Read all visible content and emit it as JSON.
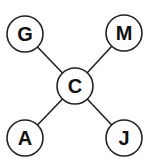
{
  "diagram": {
    "type": "star-graph",
    "colors": {
      "stroke": "#222222",
      "fill": "#ffffff",
      "text": "#111111"
    },
    "nodes": [
      {
        "id": "G",
        "label": "G",
        "x": 25,
        "y": 34
      },
      {
        "id": "M",
        "label": "M",
        "x": 124,
        "y": 33
      },
      {
        "id": "C",
        "label": "C",
        "x": 75,
        "y": 86
      },
      {
        "id": "A",
        "label": "A",
        "x": 25,
        "y": 138
      },
      {
        "id": "J",
        "label": "J",
        "x": 124,
        "y": 138
      }
    ],
    "edges": [
      {
        "from": "C",
        "to": "G"
      },
      {
        "from": "C",
        "to": "M"
      },
      {
        "from": "C",
        "to": "A"
      },
      {
        "from": "C",
        "to": "J"
      }
    ]
  }
}
